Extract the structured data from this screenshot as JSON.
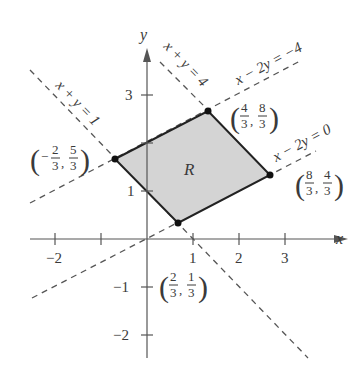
{
  "diagram": {
    "type": "coordinate-plane-region",
    "axes": {
      "x_label": "x",
      "y_label": "y",
      "x_ticks": [
        {
          "value": -2,
          "label": "−2"
        },
        {
          "value": -1,
          "label": ""
        },
        {
          "value": 1,
          "label": "1"
        },
        {
          "value": 2,
          "label": "2"
        },
        {
          "value": 3,
          "label": "3"
        }
      ],
      "y_ticks": [
        {
          "value": -2,
          "label": "−2"
        },
        {
          "value": -1,
          "label": "−1"
        },
        {
          "value": 1,
          "label": "1"
        },
        {
          "value": 2,
          "label": ""
        },
        {
          "value": 3,
          "label": "3"
        }
      ]
    },
    "region": {
      "label": "R",
      "fill": "#d4d4d4",
      "vertices": [
        {
          "x": "-2/3",
          "y": "5/3"
        },
        {
          "x": "4/3",
          "y": "8/3"
        },
        {
          "x": "8/3",
          "y": "4/3"
        },
        {
          "x": "2/3",
          "y": "1/3"
        }
      ]
    },
    "lines": [
      {
        "equation": "x + y = 1",
        "label": "x + y = 1"
      },
      {
        "equation": "x + y = 4",
        "label": "x + y = 4"
      },
      {
        "equation": "x − 2y = −4",
        "label": "x − 2y = −4"
      },
      {
        "equation": "x − 2y = 0",
        "label": "x − 2y = 0"
      }
    ],
    "vertex_labels": [
      {
        "num_x": "2",
        "den_x": "3",
        "neg_x": true,
        "num_y": "5",
        "den_y": "3"
      },
      {
        "num_x": "4",
        "den_x": "3",
        "neg_x": false,
        "num_y": "8",
        "den_y": "3"
      },
      {
        "num_x": "8",
        "den_x": "3",
        "neg_x": false,
        "num_y": "4",
        "den_y": "3"
      },
      {
        "num_x": "2",
        "den_x": "3",
        "neg_x": false,
        "num_y": "1",
        "den_y": "3"
      }
    ]
  }
}
